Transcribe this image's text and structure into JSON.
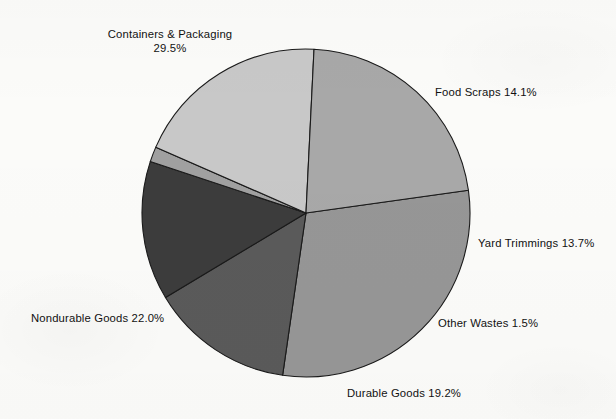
{
  "chart_data": {
    "type": "pie",
    "title": "",
    "subtitle": "",
    "xlabel": "",
    "ylabel": "",
    "legend_position": "none",
    "grid": false,
    "units": "percent",
    "total": 100.0,
    "center": {
      "x": 306,
      "y": 213
    },
    "radius": 164,
    "start_angle_deg": -8,
    "direction": "clockwise",
    "categories": [
      "Containers & Packaging",
      "Food Scraps",
      "Yard Trimmings",
      "Other Wastes",
      "Durable Goods",
      "Nondurable Goods"
    ],
    "values": [
      29.5,
      14.1,
      13.7,
      1.5,
      19.2,
      22.0
    ],
    "slices": [
      {
        "name": "Containers & Packaging",
        "value": 29.5,
        "value_label": "29.5%",
        "label_text": "Containers & Packaging",
        "label_line1": "Containers & Packaging",
        "label_line2": "29.5%",
        "color": "#969696",
        "label_position": "top-left",
        "label_x": 100,
        "label_y": 27
      },
      {
        "name": "Food Scraps",
        "value": 14.1,
        "value_label": "14.1%",
        "label_text": "Food Scraps 14.1%",
        "color": "#5a5a5a",
        "label_position": "right-upper",
        "label_x": 435,
        "label_y": 85
      },
      {
        "name": "Yard Trimmings",
        "value": 13.7,
        "value_label": "13.7%",
        "label_text": "Yard Trimmings 13.7%",
        "color": "#3c3c3c",
        "label_position": "right",
        "label_x": 478,
        "label_y": 236
      },
      {
        "name": "Other Wastes",
        "value": 1.5,
        "value_label": "1.5%",
        "label_text": "Other Wastes 1.5%",
        "color": "#a0a0a0",
        "label_position": "right-lower",
        "label_x": 438,
        "label_y": 316
      },
      {
        "name": "Durable Goods",
        "value": 19.2,
        "value_label": "19.2%",
        "label_text": "Durable Goods 19.2%",
        "color": "#c8c8c8",
        "label_position": "bottom",
        "label_x": 347,
        "label_y": 386
      },
      {
        "name": "Nondurable Goods",
        "value": 22.0,
        "value_label": "22.0%",
        "label_text": "Nondurable Goods 22.0%",
        "color": "#a8a8a8",
        "label_position": "left",
        "label_x": 31,
        "label_y": 311
      }
    ],
    "colors": {
      "outline": "#1a1a1a",
      "background": "#fbfbf9",
      "text": "#111111"
    }
  }
}
